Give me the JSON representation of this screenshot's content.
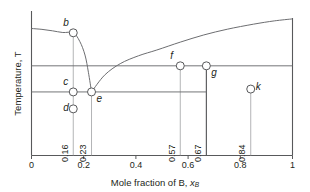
{
  "figure": {
    "kind": "binary-eutectic-phase-diagram",
    "background": "#ffffff",
    "line_color": "#6d6e71",
    "heavy_line_color": "#58595b",
    "text_color": "#231f20",
    "marker_fill": "#ffffff"
  },
  "axes": {
    "x_title_prefix": "Mole fraction of B, ",
    "x_title_symbol": "x",
    "x_title_subscript": "B",
    "y_title": "Temperature, T",
    "x_min": 0,
    "x_max": 1,
    "x_ticks": [
      "0",
      "0.2",
      "0.4",
      "0.6",
      "0.8",
      "1"
    ],
    "x_tick_values": [
      0,
      0.2,
      0.4,
      0.6,
      0.8,
      1
    ],
    "y_ticks_shown": false,
    "grid": false
  },
  "chart_data": {
    "type": "line",
    "title": "",
    "xlabel": "Mole fraction of B, xB",
    "ylabel": "Temperature, T",
    "xlim": [
      0,
      1
    ],
    "ylim": [
      0,
      1
    ],
    "grid": false,
    "legend": "none",
    "points": [
      {
        "id": "b",
        "label": "b",
        "x": 0.16,
        "y": 0.855,
        "label_pos": "above-left"
      },
      {
        "id": "c",
        "label": "c",
        "x": 0.16,
        "y": 0.443,
        "label_pos": "above-left"
      },
      {
        "id": "d",
        "label": "d",
        "x": 0.16,
        "y": 0.325,
        "label_pos": "left"
      },
      {
        "id": "e",
        "label": "e",
        "x": 0.23,
        "y": 0.443,
        "label_pos": "below-right"
      },
      {
        "id": "f",
        "label": "f",
        "x": 0.57,
        "y": 0.625,
        "label_pos": "above-left"
      },
      {
        "id": "g",
        "label": "g",
        "x": 0.67,
        "y": 0.625,
        "label_pos": "below-right"
      },
      {
        "id": "k",
        "label": "k",
        "x": 0.84,
        "y": 0.463,
        "label_pos": "right"
      }
    ],
    "drop_labels": [
      {
        "x": 0.16,
        "text": "0.16"
      },
      {
        "x": 0.23,
        "text": "0.23"
      },
      {
        "x": 0.57,
        "text": "0.57"
      },
      {
        "x": 0.67,
        "text": "0.67"
      },
      {
        "x": 0.84,
        "text": "0.84"
      }
    ],
    "series": [
      {
        "name": "left-liquidus",
        "description": "Liquidus falling from pure A to the eutectic point e",
        "x": [
          0.0,
          0.04,
          0.08,
          0.12,
          0.16,
          0.185,
          0.205,
          0.218,
          0.23
        ],
        "y": [
          0.885,
          0.879,
          0.869,
          0.857,
          0.855,
          0.795,
          0.7,
          0.58,
          0.443
        ]
      },
      {
        "name": "right-liquidus",
        "description": "Liquidus rising from the eutectic point e past f toward pure B",
        "x": [
          0.23,
          0.28,
          0.34,
          0.41,
          0.48,
          0.57,
          0.66,
          0.75,
          0.85,
          0.93,
          1.0
        ],
        "y": [
          0.443,
          0.56,
          0.64,
          0.695,
          0.735,
          0.79,
          0.84,
          0.88,
          0.915,
          0.938,
          0.952
        ]
      }
    ],
    "horizontal_lines": [
      {
        "name": "upper-tie-line",
        "y": 0.625,
        "x_start": 0.0,
        "x_end": 1.0
      },
      {
        "name": "eutectic-line",
        "y": 0.443,
        "x_start": 0.0,
        "x_end": 0.67
      }
    ],
    "vertical_lines": [
      {
        "name": "isopleth-0.16",
        "x": 0.16,
        "y_top": 0.855,
        "y_bottom": 0.0,
        "weight": "light"
      },
      {
        "name": "isopleth-0.23",
        "x": 0.23,
        "y_top": 0.443,
        "y_bottom": 0.0,
        "weight": "light"
      },
      {
        "name": "isopleth-0.57",
        "x": 0.57,
        "y_top": 0.625,
        "y_bottom": 0.0,
        "weight": "light"
      },
      {
        "name": "isopleth-0.67",
        "x": 0.67,
        "y_top": 0.625,
        "y_bottom": 0.0,
        "weight": "heavy"
      },
      {
        "name": "isopleth-0.84",
        "x": 0.84,
        "y_top": 0.463,
        "y_bottom": 0.0,
        "weight": "light"
      }
    ]
  }
}
